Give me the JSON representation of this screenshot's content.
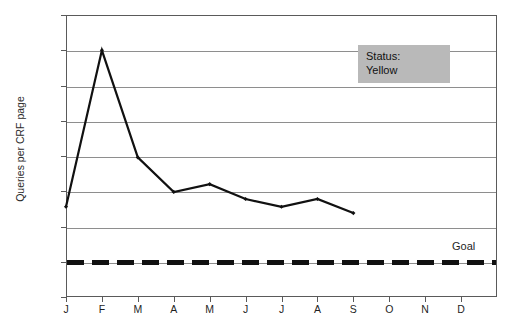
{
  "chart_data": {
    "type": "line",
    "title": "",
    "xlabel": "",
    "ylabel": "Queries per CRF page",
    "categories": [
      "J",
      "F",
      "M",
      "A",
      "M",
      "J",
      "J",
      "A",
      "S",
      "O",
      "N",
      "D"
    ],
    "series": [
      {
        "name": "Queries per CRF page",
        "values": [
          0.128,
          0.35,
          0.198,
          0.149,
          0.16,
          0.139,
          0.128,
          0.139,
          0.119,
          null,
          null,
          null
        ],
        "color": "#111111",
        "marker": "diamond"
      }
    ],
    "reference_lines": [
      {
        "label": "Goal",
        "value": 0.05,
        "style": "dashed",
        "color": "#111111"
      }
    ],
    "ylim": [
      0,
      0.4
    ],
    "yticks": [
      0,
      0.05,
      0.1,
      0.15,
      0.2,
      0.25,
      0.3,
      0.35,
      0.4
    ],
    "ytick_labels": [
      "0",
      "0.05",
      "0.1",
      "0.15",
      "0.2",
      "0.25",
      "0.3",
      "0.35",
      "0.4"
    ],
    "grid": true,
    "legend": "none",
    "annotations": [
      {
        "name": "status-callout",
        "lines": [
          "Status:",
          "Yellow"
        ],
        "background": "#b9b9b9"
      }
    ]
  },
  "labels": {
    "goal": "Goal",
    "status_heading": "Status:",
    "status_value": "Yellow",
    "ylabel": "Queries per CRF page",
    "title_cropped": ""
  },
  "colors": {
    "series": "#111111",
    "goal": "#111111",
    "grid": "#8e8e8e",
    "frame": "#5a5a5a",
    "status_bg": "#b9b9b9",
    "background": "#ffffff"
  }
}
